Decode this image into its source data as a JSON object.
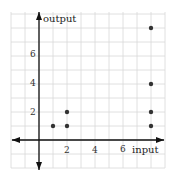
{
  "chart_data": {
    "type": "scatter",
    "title": "",
    "xlabel": "input",
    "ylabel": "output",
    "xlim": [
      -2,
      9
    ],
    "ylim": [
      -2,
      9
    ],
    "grid": true,
    "x_ticks": [
      2,
      4,
      6
    ],
    "y_ticks": [
      2,
      4,
      6
    ],
    "series": [
      {
        "name": "points",
        "points": [
          {
            "x": 1,
            "y": 1
          },
          {
            "x": 2,
            "y": 1
          },
          {
            "x": 2,
            "y": 2
          },
          {
            "x": 8,
            "y": 1
          },
          {
            "x": 8,
            "y": 2
          },
          {
            "x": 8,
            "y": 4
          },
          {
            "x": 8,
            "y": 8
          }
        ]
      }
    ]
  },
  "labels": {
    "x_axis": "input",
    "y_axis": "output",
    "x_tick_2": "2",
    "x_tick_4": "4",
    "x_tick_6": "6",
    "y_tick_2": "2",
    "y_tick_4": "4",
    "y_tick_6": "6"
  },
  "colors": {
    "grid": "#d8d8d8",
    "axis": "#111111",
    "point": "#333333"
  }
}
